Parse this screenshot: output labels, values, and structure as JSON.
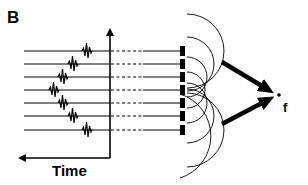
{
  "figure": {
    "panel_label": "B",
    "time_axis_label": "Time",
    "focus_label": "f",
    "colors": {
      "ink": "#000000",
      "background": "#ffffff"
    }
  },
  "channels": [
    {
      "index": 1,
      "y": 51,
      "pulse_x": 86
    },
    {
      "index": 2,
      "y": 64,
      "pulse_x": 72
    },
    {
      "index": 3,
      "y": 77,
      "pulse_x": 62
    },
    {
      "index": 4,
      "y": 90,
      "pulse_x": 53
    },
    {
      "index": 5,
      "y": 103,
      "pulse_x": 62
    },
    {
      "index": 6,
      "y": 116,
      "pulse_x": 72
    },
    {
      "index": 7,
      "y": 130,
      "pulse_x": 86
    }
  ],
  "elements": {
    "transducer_count": 7,
    "wavefront_count": 7,
    "focus_arrows": 2
  }
}
